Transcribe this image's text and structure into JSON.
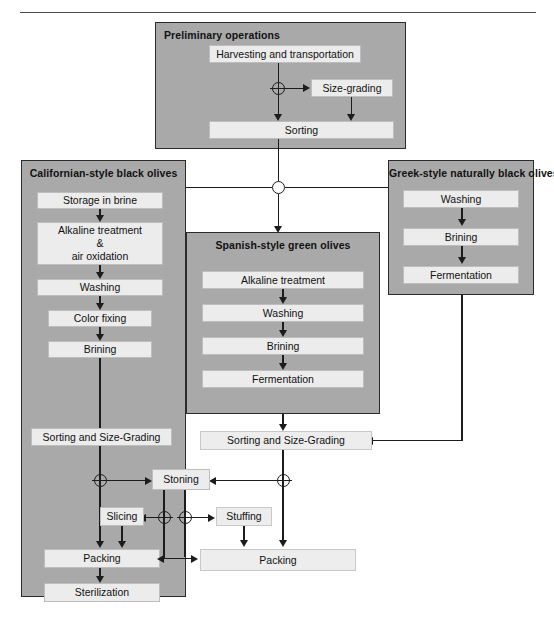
{
  "figure": {
    "colors": {
      "panel_fill": "#a9a9a9",
      "box_fill": "#ececec",
      "line": "#1c1c1c",
      "text": "#111111"
    }
  },
  "panels": [
    {
      "id": "preliminary",
      "title": "Preliminary operations",
      "steps": [
        "Harvesting and transportation",
        "Size-grading",
        "Sorting"
      ]
    },
    {
      "id": "californian",
      "title": "Californian-style black olives",
      "steps": [
        "Storage in brine",
        "Alkaline treatment\n&\nair oxidation",
        "Washing",
        "Color fixing",
        "Brining",
        "Sorting and Size-Grading",
        "Packing",
        "Sterilization"
      ]
    },
    {
      "id": "spanish",
      "title": "Spanish-style green olives",
      "steps": [
        "Alkaline treatment",
        "Washing",
        "Brining",
        "Fermentation"
      ]
    },
    {
      "id": "greek",
      "title": "Greek-style naturally black olives",
      "steps": [
        "Washing",
        "Brining",
        "Fermentation"
      ]
    }
  ],
  "boxes": {
    "harvesting": "Harvesting and transportation",
    "size_grading": "Size-grading",
    "sorting": "Sorting",
    "cal_storage": "Storage in brine",
    "cal_alkaline": "Alkaline treatment\n&\nair oxidation",
    "cal_washing": "Washing",
    "cal_color_fixing": "Color fixing",
    "cal_brining": "Brining",
    "cal_sorting_grading": "Sorting and Size-Grading",
    "cal_packing": "Packing",
    "cal_sterilization": "Sterilization",
    "sp_alkaline": "Alkaline treatment",
    "sp_washing": "Washing",
    "sp_brining": "Brining",
    "sp_fermentation": "Fermentation",
    "gr_washing": "Washing",
    "gr_brining": "Brining",
    "gr_fermentation": "Fermentation",
    "main_sorting_grading": "Sorting and Size-Grading",
    "stoning": "Stoning",
    "slicing": "Slicing",
    "stuffing": "Stuffing",
    "main_packing": "Packing"
  },
  "nodes": {
    "prelim_split": "junction-plus",
    "style_split": "junction",
    "cal_stoning_split": "junction-plus",
    "main_stoning_split": "junction-plus",
    "slicing_split": "junction-plus",
    "stuffing_split": "junction-plus"
  }
}
